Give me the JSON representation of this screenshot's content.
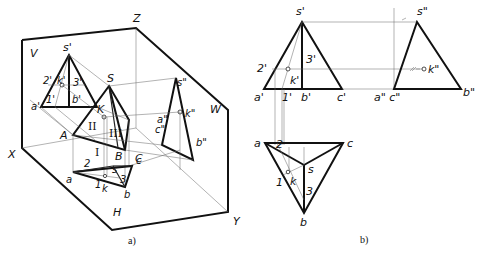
{
  "figure_a": {
    "caption": "a)",
    "axes": {
      "z": "Z",
      "x": "X",
      "y": "Y"
    },
    "planes": {
      "v": "V",
      "w": "W",
      "h": "H"
    },
    "space_points": {
      "s": "S",
      "k": "K",
      "a": "A",
      "b": "B",
      "c": "C",
      "region_1": "I",
      "region_2": "II",
      "region_3": "III"
    },
    "v_projection": {
      "s": "s'",
      "k": "k'",
      "a": "a'",
      "b": "b'",
      "p1": "1'",
      "p2": "2'",
      "p3": "3'"
    },
    "w_projection": {
      "s": "s\"",
      "k": "k\"",
      "a": "a\"",
      "c": "c\"",
      "b": "b\""
    },
    "h_projection": {
      "s": "s",
      "k": "k",
      "a": "a",
      "b": "b",
      "c": "c",
      "p1": "1",
      "p2": "2",
      "p3": "3"
    }
  },
  "figure_b": {
    "caption": "b)",
    "front_view": {
      "s": "s'",
      "k": "k'",
      "a": "a'",
      "b": "b'",
      "c": "c'",
      "p1": "1'",
      "p2": "2'",
      "p3": "3'"
    },
    "side_view": {
      "s": "s\"",
      "k": "k\"",
      "ac": "a\" c\"",
      "b": "b\""
    },
    "top_view": {
      "s": "s",
      "k": "k",
      "a": "a",
      "b": "b",
      "c": "c",
      "p1": "1",
      "p2": "2",
      "p3": "3"
    }
  }
}
